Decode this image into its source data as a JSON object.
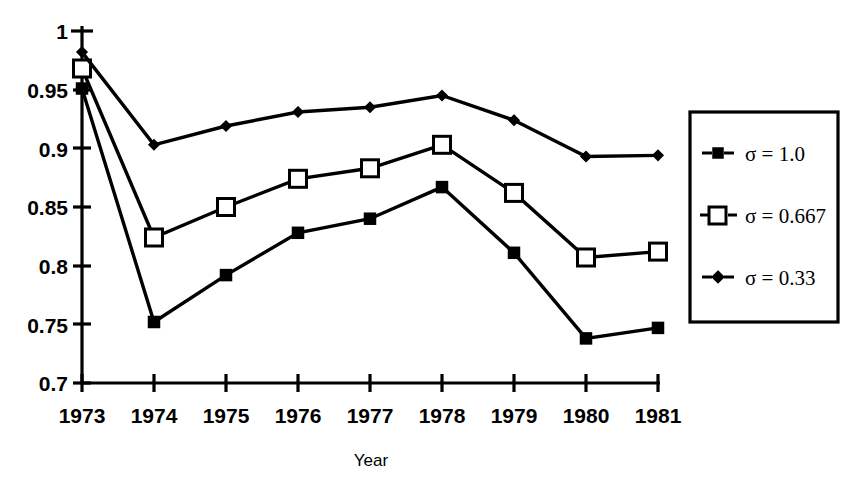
{
  "chart_data": {
    "type": "line",
    "title": "",
    "xlabel": "Year",
    "ylabel": "",
    "categories": [
      "1973",
      "1974",
      "1975",
      "1976",
      "1977",
      "1978",
      "1979",
      "1980",
      "1981"
    ],
    "x": [
      1973,
      1974,
      1975,
      1976,
      1977,
      1978,
      1979,
      1980,
      1981
    ],
    "xlim": [
      1973,
      1981
    ],
    "ylim": [
      0.7,
      1.0
    ],
    "yticks": [
      0.7,
      0.75,
      0.8,
      0.85,
      0.9,
      0.95,
      1
    ],
    "ytick_labels": [
      "0.7",
      "0.75",
      "0.8",
      "0.85",
      "0.9",
      "0.95",
      "1"
    ],
    "grid": false,
    "legend_position": "right-outside",
    "series": [
      {
        "name": "σ = 1.0",
        "marker": "filled-square",
        "values": [
          0.951,
          0.752,
          0.792,
          0.828,
          0.84,
          0.867,
          0.811,
          0.738,
          0.747
        ]
      },
      {
        "name": "σ = 0.667",
        "marker": "open-square",
        "values": [
          0.968,
          0.824,
          0.85,
          0.874,
          0.883,
          0.903,
          0.862,
          0.807,
          0.812
        ]
      },
      {
        "name": "σ = 0.33",
        "marker": "small-diamond",
        "values": [
          0.982,
          0.903,
          0.919,
          0.931,
          0.935,
          0.945,
          0.924,
          0.893,
          0.894
        ]
      }
    ],
    "colors": {
      "ink": "#000000",
      "background": "#ffffff"
    }
  },
  "legend": {
    "items": [
      {
        "label": "σ = 1.0",
        "marker": "filled-square"
      },
      {
        "label": "σ = 0.667",
        "marker": "open-square"
      },
      {
        "label": "σ = 0.33",
        "marker": "small-diamond"
      }
    ]
  },
  "axes": {
    "x_title": "Year",
    "x_tick_labels": [
      "1973",
      "1974",
      "1975",
      "1976",
      "1977",
      "1978",
      "1979",
      "1980",
      "1981"
    ],
    "y_tick_labels": [
      "1",
      "0.95",
      "0.9",
      "0.85",
      "0.8",
      "0.75",
      "0.7"
    ]
  }
}
